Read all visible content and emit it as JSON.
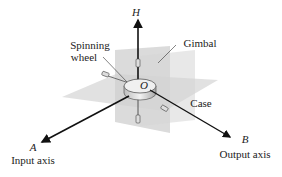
{
  "diagram": {
    "labels": {
      "h_axis": "H",
      "origin": "O",
      "spinning_wheel_line1": "Spinning",
      "spinning_wheel_line2": "wheel",
      "gimbal": "Gimbal",
      "case": "Case",
      "a_axis": "A",
      "input_axis": "Input axis",
      "b_axis": "B",
      "output_axis": "Output axis"
    },
    "colors": {
      "plane_fill": "#d9d9d9",
      "plane_fill_dark": "#cfcfcf",
      "axis_stroke": "#111111",
      "text": "#222222"
    }
  }
}
